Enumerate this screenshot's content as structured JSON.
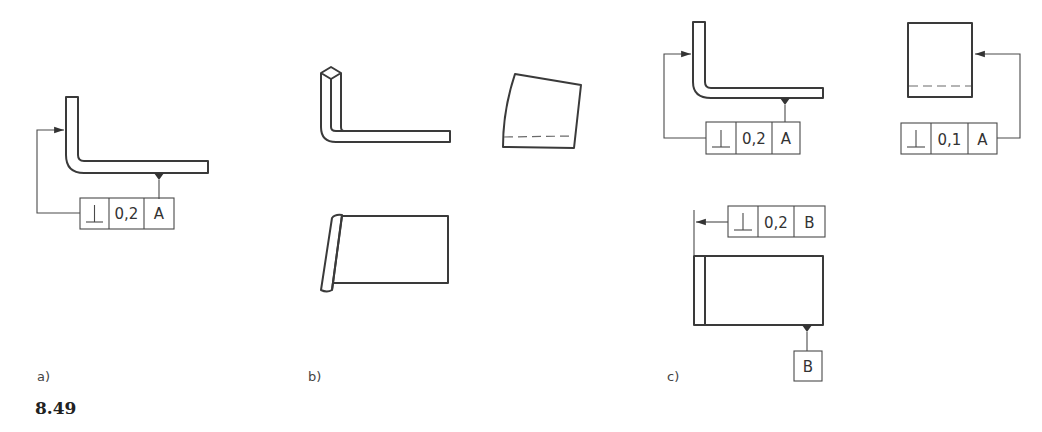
{
  "figure_number": "8.49",
  "panels": {
    "a": {
      "label": "a)",
      "fcf": {
        "symbol": "⊥",
        "tolerance": "0,2",
        "datum": "A"
      }
    },
    "b": {
      "label": "b)"
    },
    "c": {
      "label": "c)",
      "fcf_top_left": {
        "symbol": "⊥",
        "tolerance": "0,2",
        "datum": "A"
      },
      "fcf_top_right": {
        "symbol": "⊥",
        "tolerance": "0,1",
        "datum": "A"
      },
      "fcf_bottom": {
        "symbol": "⊥",
        "tolerance": "0,2",
        "datum": "B"
      },
      "datum_label": "B"
    }
  }
}
